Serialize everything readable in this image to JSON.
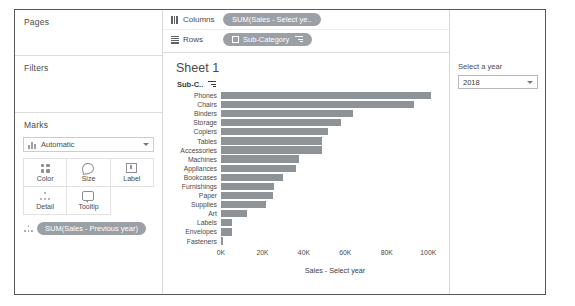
{
  "left_pane": {
    "pages": {
      "title": "Pages"
    },
    "filters": {
      "title": "Filters"
    },
    "marks": {
      "title": "Marks",
      "mark_type": "Automatic",
      "buttons": [
        {
          "label": "Color",
          "icon": "color-icon"
        },
        {
          "label": "Size",
          "icon": "size-icon"
        },
        {
          "label": "Label",
          "icon": "label-icon"
        },
        {
          "label": "Detail",
          "icon": "detail-icon"
        },
        {
          "label": "Tooltip",
          "icon": "tooltip-icon"
        }
      ],
      "pill": "SUM(Sales - Previous year)"
    }
  },
  "shelves": {
    "columns": {
      "label": "Columns",
      "pill": "SUM(Sales - Select ye.."
    },
    "rows": {
      "label": "Rows",
      "pill": "Sub-Category"
    }
  },
  "viz": {
    "sheet_title": "Sheet 1",
    "row_header": "Sub-C.."
  },
  "filter_panel": {
    "title": "Select a year",
    "selected_year": "2018"
  },
  "colors": {
    "bar": "#8e9398",
    "pill": "#9aa0a6",
    "border": "#555a5e"
  },
  "chart_data": {
    "type": "bar",
    "orientation": "horizontal",
    "title": "Sheet 1",
    "xlabel": "Sales - Select year",
    "ylabel": "Sub-Category",
    "xlim": [
      0,
      110000
    ],
    "xticks": [
      "0K",
      "20K",
      "40K",
      "60K",
      "80K",
      "100K"
    ],
    "xtick_values": [
      0,
      20000,
      40000,
      60000,
      80000,
      100000
    ],
    "grid": false,
    "legend": "none",
    "categories": [
      "Phones",
      "Chairs",
      "Binders",
      "Storage",
      "Copiers",
      "Tables",
      "Accessories",
      "Machines",
      "Appliances",
      "Bookcases",
      "Furnishings",
      "Paper",
      "Supplies",
      "Art",
      "Labels",
      "Envelopes",
      "Fasteners"
    ],
    "values": [
      101500,
      93000,
      63500,
      58000,
      51500,
      48500,
      48500,
      37500,
      36000,
      30000,
      25500,
      25000,
      21500,
      12500,
      5500,
      5500,
      1200
    ]
  }
}
